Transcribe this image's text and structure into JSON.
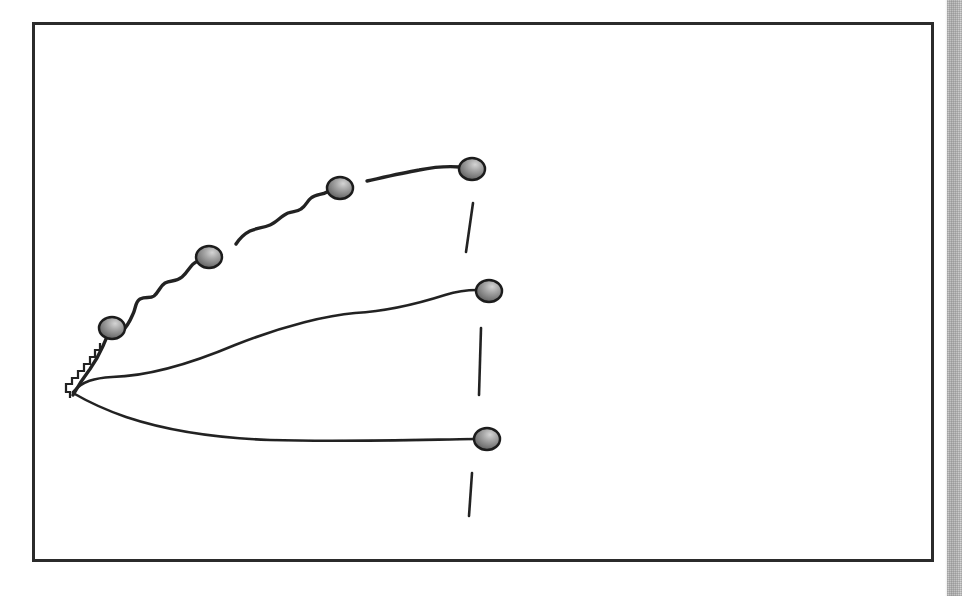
{
  "page": {
    "width": 968,
    "height": 596,
    "background_color": "#ffffff"
  },
  "frame": {
    "x": 32,
    "y": 22,
    "width": 902,
    "height": 540,
    "stroke_color": "#2b2b2b",
    "stroke_width": 3,
    "fill": "#ffffff"
  },
  "scan_artifact": {
    "label": "scanner edge strip",
    "x": 947,
    "width": 15,
    "color": "#c4c4c4"
  },
  "marker_style": {
    "rx": 13,
    "ry": 11,
    "outline_color": "#1e1e1e",
    "outline_width": 2.5,
    "fill_light": "#c9c9c9",
    "fill_mid": "#8f8f8f",
    "fill_dark": "#595959"
  },
  "curve_style": {
    "stroke_color": "#242424",
    "stroke_width_top": 3.4,
    "stroke_width_mid": 2.6,
    "stroke_width_bottom": 2.6,
    "stroke_width_tick": 2.6,
    "stroke_width_zigzag": 2.2
  },
  "chart_data": {
    "type": "line",
    "title": "",
    "xlabel": "",
    "ylabel": "",
    "grid": false,
    "legend": "none",
    "axis_ranges": {
      "x": [
        73,
        500
      ],
      "y": [
        169,
        440
      ]
    },
    "origin_point": {
      "x": 73,
      "y": 390
    },
    "series": [
      {
        "name": "upper-curve",
        "description": "steeply rising wiggly staircase curve with four ball markers",
        "style": "wiggly",
        "path": "M 73,394 C 76,386 80,378 85,372 C 90,366 96,360 101,352 C 106,344 108,336 112,330",
        "segments": [
          {
            "id": "seg-1",
            "path": "M 73,395 C 78,386 84,377 90,369 C 95,362 99,355 103,346 C 106,339 108,334 111,329"
          },
          {
            "id": "seg-2",
            "path": "M 122,331 C 127,327 130,321 133,314 C 136,308 135,302 140,299 C 146,296 150,299 154,296 C 159,292 160,286 165,283 C 171,280 176,282 182,277 C 189,271 190,265 196,262 C 201,259 204,259 208,258"
          },
          {
            "id": "seg-3",
            "path": "M 236,244 C 240,238 244,234 250,231 C 256,228 263,228 270,225 C 277,222 281,216 288,213 C 293,211 297,212 301,209 C 306,206 307,201 311,198 C 316,194 322,195 327,192 C 332,189 335,188 339,187"
          },
          {
            "id": "seg-4",
            "path": "M 367,181 C 385,177 402,173 419,170 C 434,167 448,166 460,167"
          }
        ],
        "markers": [
          {
            "x": 112,
            "y": 328
          },
          {
            "x": 209,
            "y": 257
          },
          {
            "x": 340,
            "y": 188
          },
          {
            "x": 472,
            "y": 169
          }
        ]
      },
      {
        "name": "middle-curve",
        "description": "smooth concave arc rising gently to the right",
        "style": "smooth",
        "path": "M 73,392 C 82,381 95,378 112,377 C 150,376 190,364 235,345 C 285,325 330,315 355,313 C 390,311 420,303 445,295 C 458,291 468,290 477,290",
        "markers": [
          {
            "x": 489,
            "y": 291
          }
        ]
      },
      {
        "name": "lower-curve",
        "description": "smooth arc falling then flattening toward the right",
        "style": "smooth",
        "path": "M 73,393 C 85,400 103,409 126,417 C 165,430 215,438 270,440 C 340,442 410,440 475,439",
        "markers": [
          {
            "x": 487,
            "y": 439
          }
        ]
      }
    ],
    "origin_zigzag": {
      "description": "small staircase / sawtooth detail at the common origin of the curves",
      "path": "M 66,391 L 66,384 L 72,384 L 72,378 L 78,378 L 78,371 L 84,371 L 84,364 L 90,364 L 90,357 L 95,357 L 95,350 L 100,350 L 100,344"
    },
    "origin_stub": {
      "description": "short tail below the origin",
      "path": "M 66,392 L 70,392 L 70,397"
    },
    "end_ticks": [
      {
        "name": "tick-upper",
        "x1": 473,
        "y1": 203,
        "x2": 466,
        "y2": 252
      },
      {
        "name": "tick-middle",
        "x1": 481,
        "y1": 328,
        "x2": 479,
        "y2": 395
      },
      {
        "name": "tick-lower",
        "x1": 472,
        "y1": 473,
        "x2": 469,
        "y2": 516
      }
    ]
  }
}
